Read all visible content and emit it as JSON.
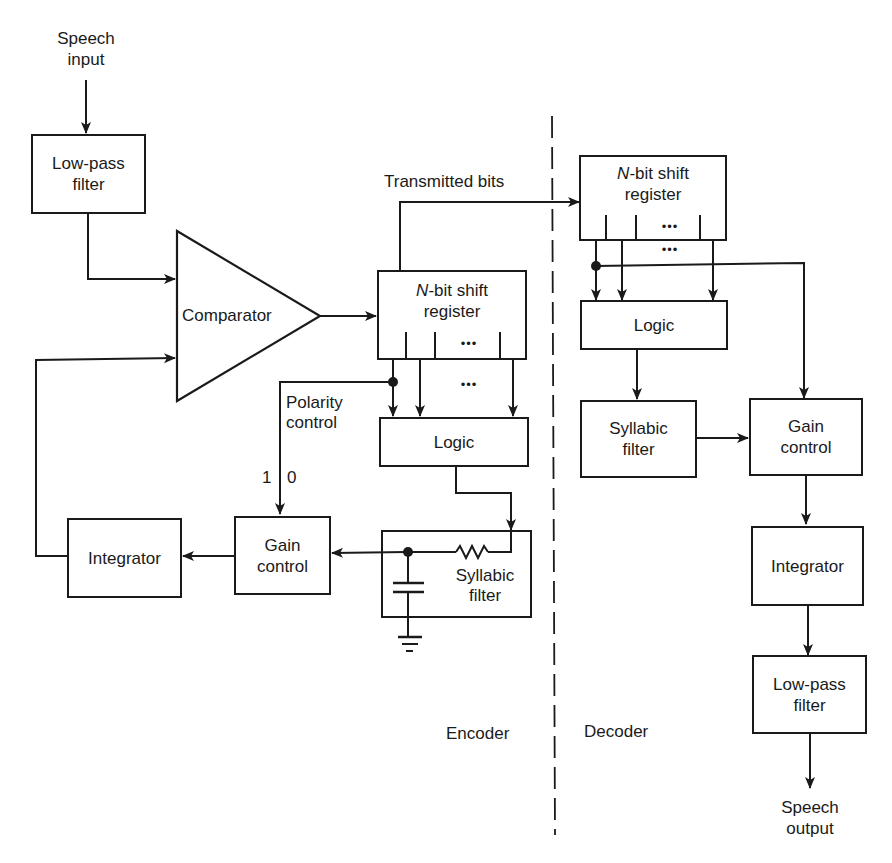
{
  "diagram": {
    "title": "",
    "type": "block-diagram",
    "sections": {
      "encoder_label": "Encoder",
      "decoder_label": "Decoder"
    },
    "io": {
      "input_line1": "Speech",
      "input_line2": "input",
      "output_line1": "Speech",
      "output_line2": "output"
    },
    "labels": {
      "transmitted_bits": "Transmitted bits",
      "polarity_line1": "Polarity",
      "polarity_line2": "control",
      "one": "1",
      "zero": "0",
      "ellipsis": "•••"
    },
    "encoder": {
      "lowpass": {
        "line1": "Low-pass",
        "line2": "filter"
      },
      "comparator": {
        "label": "Comparator"
      },
      "shift_register": {
        "n": "N",
        "line1_rest": "-bit shift",
        "line2": "register"
      },
      "logic": {
        "label": "Logic"
      },
      "syllabic": {
        "line1": "Syllabic",
        "line2": "filter"
      },
      "gain": {
        "line1": "Gain",
        "line2": "control"
      },
      "integrator": {
        "label": "Integrator"
      }
    },
    "decoder": {
      "shift_register": {
        "n": "N",
        "line1_rest": "-bit shift",
        "line2": "register"
      },
      "logic": {
        "label": "Logic"
      },
      "syllabic": {
        "line1": "Syllabic",
        "line2": "filter"
      },
      "gain": {
        "line1": "Gain",
        "line2": "control"
      },
      "integrator": {
        "label": "Integrator"
      },
      "lowpass": {
        "line1": "Low-pass",
        "line2": "filter"
      }
    },
    "nodes": [
      "Speech input",
      "Low-pass filter",
      "Comparator",
      "N-bit shift register (encoder)",
      "Logic (encoder)",
      "Syllabic filter (encoder)",
      "Gain control (encoder)",
      "Integrator (encoder)",
      "N-bit shift register (decoder)",
      "Logic (decoder)",
      "Syllabic filter (decoder)",
      "Gain control (decoder)",
      "Integrator (decoder)",
      "Low-pass filter (decoder)",
      "Speech output"
    ],
    "edges": [
      [
        "Speech input",
        "Low-pass filter"
      ],
      [
        "Low-pass filter",
        "Comparator"
      ],
      [
        "Integrator (encoder)",
        "Comparator"
      ],
      [
        "Comparator",
        "N-bit shift register (encoder)"
      ],
      [
        "N-bit shift register (encoder)",
        "N-bit shift register (decoder)",
        "Transmitted bits"
      ],
      [
        "N-bit shift register (encoder)",
        "Logic (encoder)"
      ],
      [
        "N-bit shift register (encoder)",
        "Gain control (encoder)",
        "Polarity control"
      ],
      [
        "Logic (encoder)",
        "Syllabic filter (encoder)"
      ],
      [
        "Syllabic filter (encoder)",
        "Gain control (encoder)"
      ],
      [
        "Gain control (encoder)",
        "Integrator (encoder)"
      ],
      [
        "N-bit shift register (decoder)",
        "Logic (decoder)"
      ],
      [
        "N-bit shift register (decoder)",
        "Gain control (decoder)"
      ],
      [
        "Logic (decoder)",
        "Syllabic filter (decoder)"
      ],
      [
        "Syllabic filter (decoder)",
        "Gain control (decoder)"
      ],
      [
        "Gain control (decoder)",
        "Integrator (decoder)"
      ],
      [
        "Integrator (decoder)",
        "Low-pass filter (decoder)"
      ],
      [
        "Low-pass filter (decoder)",
        "Speech output"
      ]
    ]
  }
}
